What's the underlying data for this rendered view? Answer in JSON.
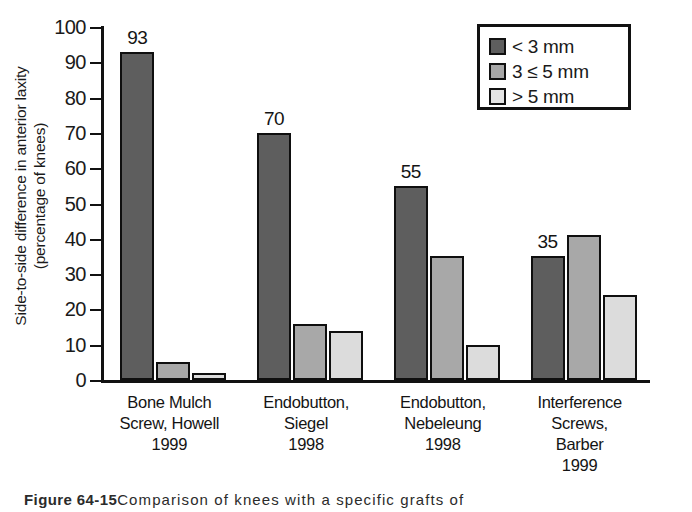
{
  "chart_data": {
    "type": "bar",
    "title": "",
    "xlabel": "",
    "ylabel": "Side-to-side difference in anterior laxity (percentage of knees)",
    "ylabel_line1": "Side-to-side difference in anterior laxity",
    "ylabel_line2": "(percentage of knees)",
    "ylim": [
      0,
      100
    ],
    "ytick_values": [
      0,
      10,
      20,
      30,
      40,
      50,
      60,
      70,
      80,
      90,
      100
    ],
    "ytick_labels": [
      "0",
      "10",
      "20",
      "30",
      "40",
      "50",
      "60",
      "70",
      "80",
      "90",
      "100"
    ],
    "grid": false,
    "legend_position": "top-right",
    "categories": [
      "Bone Mulch Screw, Howell 1999",
      "Endobutton, Siegel 1998",
      "Endobutton, Nebeleung 1998",
      "Interference Screws, Barber 1999"
    ],
    "category_lines": [
      [
        "Bone Mulch",
        "Screw, Howell",
        "1999"
      ],
      [
        "Endobutton,",
        "Siegel",
        "1998"
      ],
      [
        "Endobutton,",
        "Nebeleung",
        "1998"
      ],
      [
        "Interference",
        "Screws,",
        "Barber",
        "1999"
      ]
    ],
    "series": [
      {
        "name": "< 3 mm",
        "color": "#5e5e5e",
        "values": [
          93,
          70,
          55,
          35
        ],
        "labels": [
          "93",
          "70",
          "55",
          "35"
        ]
      },
      {
        "name": "3 ≤ 5 mm",
        "color": "#a8a8a8",
        "values": [
          5,
          16,
          35,
          41
        ],
        "labels": [
          "",
          "",
          "",
          ""
        ]
      },
      {
        "name": "> 5 mm",
        "color": "#dcdcdc",
        "values": [
          2,
          14,
          10,
          24
        ],
        "labels": [
          "",
          "",
          "",
          ""
        ]
      }
    ],
    "legend": [
      {
        "label": "< 3 mm",
        "swatch": "#5e5e5e"
      },
      {
        "label": "3 ≤ 5 mm",
        "swatch": "#a8a8a8"
      },
      {
        "label": "> 5 mm",
        "swatch": "#e4e4e4"
      }
    ]
  },
  "caption": {
    "figure_number": "Figure 64-15",
    "text": "Comparison of knees with a specific grafts of"
  },
  "colors": {
    "series_dark": "#5e5e5e",
    "series_medium": "#a8a8a8",
    "series_light": "#dcdcdc",
    "axis": "#111111",
    "background": "#ffffff"
  }
}
